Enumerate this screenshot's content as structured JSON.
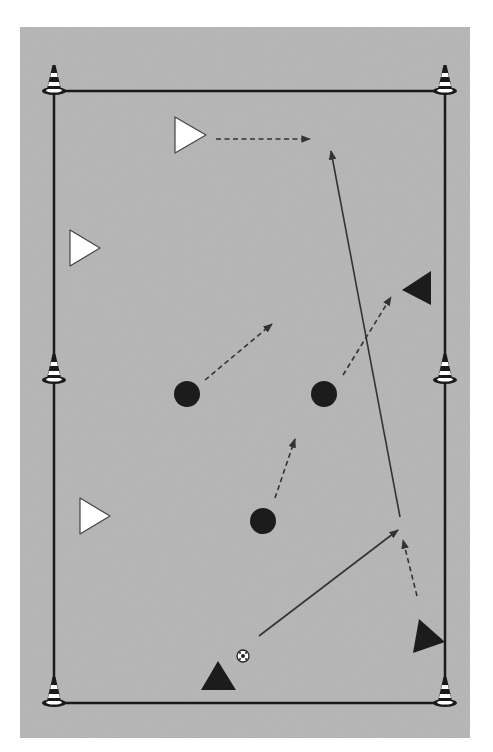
{
  "diagram": {
    "type": "soccer-drill",
    "background_color": "#b9b9b9",
    "line_color": "#1a1a1a",
    "pitch": {
      "left": 54,
      "right": 445,
      "top": 91,
      "bottom": 703
    },
    "cones": [
      {
        "id": "cone-top-left",
        "x": 54,
        "y": 91
      },
      {
        "id": "cone-top-right",
        "x": 445,
        "y": 91
      },
      {
        "id": "cone-mid-left",
        "x": 54,
        "y": 380
      },
      {
        "id": "cone-mid-right",
        "x": 445,
        "y": 380
      },
      {
        "id": "cone-bottom-left",
        "x": 54,
        "y": 703
      },
      {
        "id": "cone-bottom-right",
        "x": 445,
        "y": 703
      }
    ],
    "white_players": [
      {
        "id": "white-player-1",
        "points": "175,117 175,153 206,135"
      },
      {
        "id": "white-player-2",
        "points": "70,230 70,266 100,248"
      },
      {
        "id": "white-player-3",
        "points": "80,498 80,534 110,516"
      }
    ],
    "black_players": [
      {
        "id": "black-player-1",
        "points": "431,271 431,305 402,290"
      },
      {
        "id": "black-player-2",
        "points": "201,690 218,661 236,690"
      },
      {
        "id": "black-player-3",
        "points": "419,619 445,642 413,653"
      }
    ],
    "defenders": [
      {
        "id": "defender-1",
        "cx": 187,
        "cy": 394,
        "r": 13
      },
      {
        "id": "defender-2",
        "cx": 324,
        "cy": 394,
        "r": 13
      },
      {
        "id": "defender-3",
        "cx": 263,
        "cy": 521,
        "r": 13
      }
    ],
    "ball": {
      "cx": 243,
      "cy": 656,
      "r": 6
    },
    "runs_dashed": [
      {
        "id": "run-1",
        "x1": 216,
        "y1": 139,
        "x2": 310,
        "y2": 139
      },
      {
        "id": "run-2",
        "x1": 205,
        "y1": 380,
        "x2": 272,
        "y2": 324
      },
      {
        "id": "run-3",
        "x1": 343,
        "y1": 375,
        "x2": 391,
        "y2": 297
      },
      {
        "id": "run-4",
        "x1": 275,
        "y1": 498,
        "x2": 295,
        "y2": 439
      },
      {
        "id": "run-5",
        "x1": 417,
        "y1": 596,
        "x2": 403,
        "y2": 540
      }
    ],
    "passes_solid": [
      {
        "id": "pass-1",
        "x1": 259,
        "y1": 636,
        "x2": 398,
        "y2": 530
      },
      {
        "id": "pass-2",
        "x1": 400,
        "y1": 517,
        "x2": 331,
        "y2": 151
      }
    ]
  }
}
